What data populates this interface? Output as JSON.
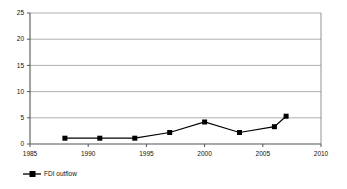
{
  "chart_data": {
    "type": "line",
    "title": "",
    "xlabel": "",
    "ylabel": "",
    "x": [
      1988,
      1991,
      1994,
      1997,
      2000,
      2003,
      2006,
      2007
    ],
    "series": [
      {
        "name": "FDI outflow",
        "values": [
          1.1,
          1.1,
          1.1,
          2.2,
          4.2,
          2.2,
          3.3,
          5.3
        ],
        "color": "#000000",
        "marker": "square"
      }
    ],
    "xlim": [
      1985,
      2010
    ],
    "ylim": [
      0,
      25
    ],
    "xticks": [
      1985,
      1990,
      1995,
      2000,
      2005,
      2010
    ],
    "yticks": [
      0,
      5,
      10,
      15,
      20,
      25
    ],
    "xtick_labels": [
      "1985",
      "1990",
      "1995",
      "2000",
      "2005",
      "2010"
    ],
    "ytick_labels": [
      "0",
      "5",
      "10",
      "15",
      "20",
      "25"
    ],
    "grid": "horizontal",
    "legend_position": "bottom-left",
    "plot_background": "#ffffff",
    "gridline_color": "#999999",
    "axis_color": "#555555"
  },
  "legend": {
    "entries": [
      {
        "label": "FDI outflow",
        "marker_icon": "square-marker-icon"
      }
    ]
  }
}
